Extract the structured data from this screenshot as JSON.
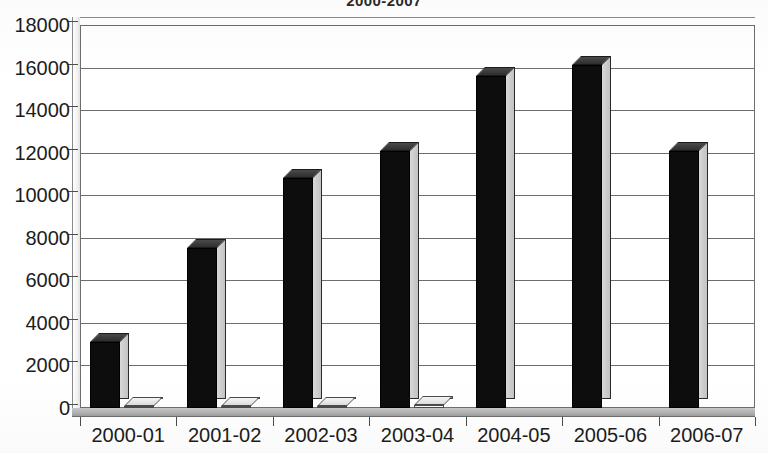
{
  "chart_data": {
    "type": "bar",
    "title": "2000-2007",
    "xlabel": "",
    "ylabel": "",
    "categories": [
      "2000-01",
      "2001-02",
      "2002-03",
      "2003-04",
      "2004-05",
      "2005-06",
      "2006-07"
    ],
    "series": [
      {
        "name": "Series 1",
        "color": "#0d0d0d",
        "values": [
          3100,
          7500,
          10800,
          12100,
          15600,
          16100,
          12100
        ]
      },
      {
        "name": "Series 2",
        "color": "#fbfbfb",
        "values": [
          110,
          110,
          100,
          120,
          0,
          0,
          0
        ]
      }
    ],
    "ylim": [
      0,
      18000
    ],
    "ytick_values": [
      0,
      2000,
      4000,
      6000,
      8000,
      10000,
      12000,
      14000,
      16000,
      18000
    ],
    "ytick_labels": [
      "0",
      "2000",
      "4000",
      "6000",
      "8000",
      "10000",
      "12000",
      "14000",
      "16000",
      "18000"
    ],
    "grid": true,
    "legend": false,
    "style_3d": true
  }
}
